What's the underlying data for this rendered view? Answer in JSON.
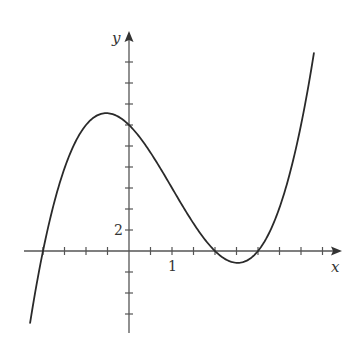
{
  "chart_data": {
    "type": "line",
    "title": "",
    "xlabel": "x",
    "ylabel": "y",
    "function": "y = (x+2)(x-2)(x-3) = x^3 - 3x^2 - 4x + 12",
    "xlim": [
      -2.45,
      4.9
    ],
    "ylim": [
      -7.9,
      21.2
    ],
    "x_tick_step": 0.5,
    "y_tick_step": 2,
    "tick_labels": {
      "x": [
        {
          "value": 1,
          "label": "1"
        }
      ],
      "y": [
        {
          "value": 2,
          "label": "2"
        }
      ]
    },
    "grid": false,
    "legend": null,
    "key_points": {
      "roots": [
        -2,
        2,
        3
      ],
      "y_intercept": 12,
      "local_max": [
        -0.53,
        13.1
      ],
      "local_min": [
        2.53,
        -1.13
      ]
    },
    "series": [
      {
        "name": "f(x)",
        "x": [
          -2.3,
          -2.0,
          -1.5,
          -1.0,
          -0.5,
          0.0,
          0.5,
          1.0,
          1.5,
          2.0,
          2.5,
          3.0,
          3.5,
          4.0,
          4.3
        ],
        "values": [
          -6.8,
          0.0,
          7.9,
          12.0,
          13.1,
          12.0,
          9.6,
          6.0,
          2.6,
          0.0,
          -1.1,
          0.0,
          4.1,
          12.0,
          18.8
        ]
      }
    ]
  },
  "labels": {
    "x_axis": "x",
    "y_axis": "y",
    "x_tick_1": "1",
    "y_tick_2": "2"
  },
  "colors": {
    "axis": "#555555",
    "curve": "#2a2a2a",
    "background": "#ffffff"
  }
}
